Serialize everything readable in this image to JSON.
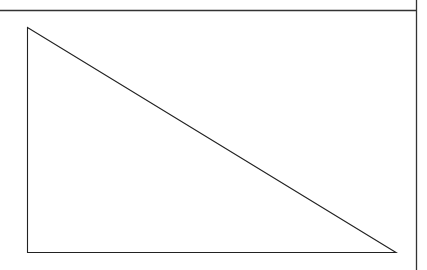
{
  "diagram": {
    "title": "",
    "shapes": [
      {
        "type": "right-triangle",
        "label": ""
      }
    ],
    "colors": {
      "background": "#ffffff",
      "stroke": "#222222",
      "frame": "#333333"
    }
  }
}
